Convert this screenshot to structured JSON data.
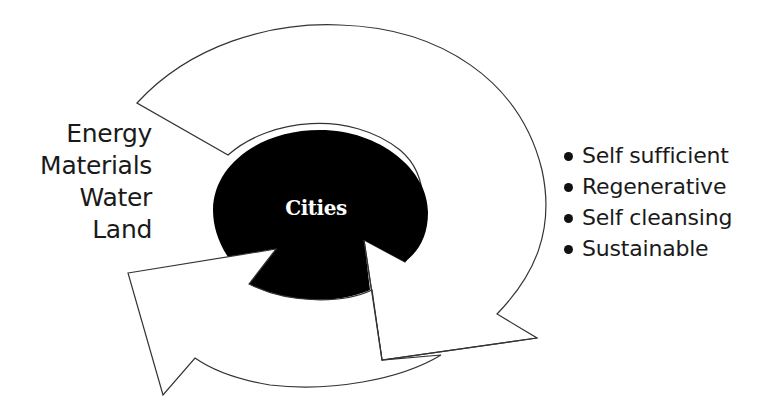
{
  "diagram": {
    "center": {
      "label": "Cities"
    },
    "inputs": [
      "Energy",
      "Materials",
      "Water",
      "Land"
    ],
    "outcomes": [
      "Self sufficient",
      "Regenerative",
      "Self cleansing",
      "Sustainable"
    ],
    "colors": {
      "center_fill": "#000000",
      "arrow_fill": "#ffffff",
      "arrow_stroke": "#333333",
      "text": "#1a1a1a"
    }
  }
}
